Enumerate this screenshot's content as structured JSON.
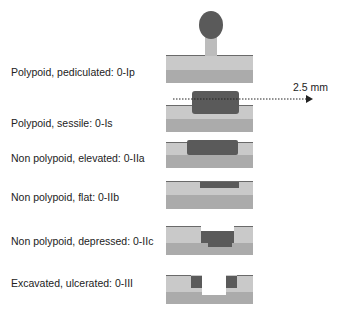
{
  "figure": {
    "scale_label": "2.5 mm",
    "colors": {
      "lesion": "#5a5a5a",
      "mucosa_top": "#c9c9c9",
      "submucosa": "#ababab",
      "surface_line": "#6a6a6a",
      "stalk": "#bcbcbc"
    },
    "rows": [
      {
        "label": "Polypoid, pediculated: 0-Ip",
        "type": "0-Ip"
      },
      {
        "label": "Polypoid, sessile: 0-Is",
        "type": "0-Is"
      },
      {
        "label": "Non polypoid, elevated: 0-IIa",
        "type": "0-IIa"
      },
      {
        "label": "Non polypoid, flat: 0-IIb",
        "type": "0-IIb"
      },
      {
        "label": "Non polypoid, depressed: 0-IIc",
        "type": "0-IIc"
      },
      {
        "label": "Excavated, ulcerated: 0-III",
        "type": "0-III"
      }
    ]
  }
}
